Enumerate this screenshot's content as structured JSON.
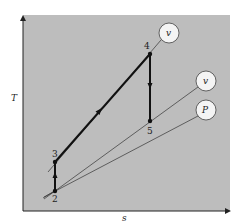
{
  "diagram": {
    "title": "",
    "type": "T-s diagram",
    "axes": {
      "y_label": "T",
      "x_label": "s"
    },
    "background_color": "#bdbdbd",
    "points": [
      {
        "id": "2",
        "label": "2"
      },
      {
        "id": "3",
        "label": "3"
      },
      {
        "id": "4",
        "label": "4"
      },
      {
        "id": "5",
        "label": "5"
      }
    ],
    "process_lines": [
      {
        "from": "2",
        "to": "3",
        "direction": "up"
      },
      {
        "from": "3",
        "to": "4",
        "direction": "up-right"
      },
      {
        "from": "4",
        "to": "5",
        "direction": "down"
      }
    ],
    "property_lines": [
      {
        "label": "v",
        "through": [
          "3",
          "4"
        ]
      },
      {
        "label": "v",
        "through": [
          "2",
          "5"
        ]
      },
      {
        "label": "P",
        "through": [
          "2"
        ]
      }
    ]
  }
}
